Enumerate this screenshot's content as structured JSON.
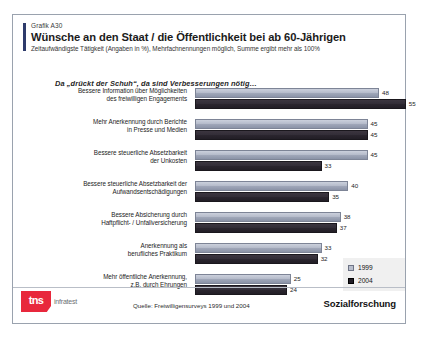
{
  "header": {
    "kicker": "Grafik A30",
    "title": "Wünsche an den Staat / die Öffentlichkeit bei ab 60-Jährigen",
    "subtitle": "Zeitaufwändigste Tätigkeit (Angaben in %), Mehrfachnennungen möglich, Summe ergibt mehr als 100%"
  },
  "lead_in": "Da „drückt der Schuh“, da sind Verbesserungen nötig…",
  "legend": {
    "items": [
      {
        "label": "1999",
        "color": "#b9bfcd"
      },
      {
        "label": "2004",
        "color": "#211d25"
      }
    ]
  },
  "footer": {
    "logo_mark": "tns",
    "logo_word": "infratest",
    "source": "Quelle: Freiwilligensurveys 1999 und 2004",
    "department": "Sozialforschung"
  },
  "chart_data": {
    "type": "bar",
    "orientation": "horizontal",
    "title": "Wünsche an den Staat / die Öffentlichkeit bei ab 60-Jährigen",
    "subtitle": "Zeitaufwändigste Tätigkeit (Angaben in %), Mehrfachnennungen möglich, Summe ergibt mehr als 100%",
    "xlabel": "",
    "ylabel": "",
    "xlim": [
      0,
      60
    ],
    "grid": false,
    "legend_position": "right",
    "categories": [
      "Bessere Information über Möglichkeiten des freiwilligen Engagements",
      "Mehr Anerkennung durch Berichte in Presse und Medien",
      "Bessere steuerliche Absetzbarkeit der Unkosten",
      "Bessere steuerliche Absetzbarkeit der Aufwandsentschädigungen",
      "Bessere Absicherung durch Haftpflicht- / Unfallversicherung",
      "Anerkennung als berufliches Praktikum",
      "Mehr öffentliche Anerkennung, z.B. durch Ehrungen"
    ],
    "category_lines": [
      [
        "Bessere Information über Möglichkeiten",
        "des freiwilligen Engagements"
      ],
      [
        "Mehr Anerkennung durch Berichte",
        "in Presse und Medien"
      ],
      [
        "Bessere steuerliche Absetzbarkeit",
        "der Unkosten"
      ],
      [
        "Bessere steuerliche Absetzbarkeit der",
        "Aufwandsentschädigungen"
      ],
      [
        "Bessere Absicherung durch",
        "Haftpflicht- / Unfallversicherung"
      ],
      [
        "Anerkennung als",
        "berufliches Praktikum"
      ],
      [
        "Mehr öffentliche Anerkennung,",
        "z.B.  durch Ehrungen"
      ]
    ],
    "series": [
      {
        "name": "1999",
        "color": "#b9bfcd",
        "values": [
          48,
          45,
          45,
          40,
          38,
          33,
          25
        ]
      },
      {
        "name": "2004",
        "color": "#211d25",
        "values": [
          55,
          45,
          33,
          35,
          37,
          32,
          24
        ]
      }
    ]
  }
}
